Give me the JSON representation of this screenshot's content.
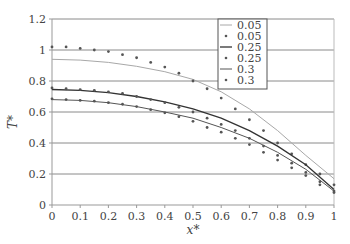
{
  "chart_data": {
    "type": "line",
    "title": "",
    "xlabel": "x*",
    "ylabel": "T*",
    "xlim": [
      0,
      1
    ],
    "ylim": [
      0,
      1.2
    ],
    "xticks": [
      "0",
      "0.1",
      "0.2",
      "0.3",
      "0.4",
      "0.5",
      "0.6",
      "0.7",
      "0.8",
      "0.9",
      "1"
    ],
    "yticks": [
      "0",
      "0.2",
      "0.4",
      "0.6",
      "0.8",
      "1",
      "1.2"
    ],
    "grid": "horizontal",
    "legend_position": "upper right (inside)",
    "series": [
      {
        "name": "0.05",
        "style": "line",
        "color": "#a8a8a8",
        "x": [
          0,
          0.1,
          0.2,
          0.3,
          0.4,
          0.5,
          0.55,
          0.6,
          0.7,
          0.8,
          0.85,
          0.9,
          1.0
        ],
        "y": [
          0.94,
          0.935,
          0.92,
          0.895,
          0.86,
          0.81,
          0.77,
          0.73,
          0.62,
          0.48,
          0.4,
          0.32,
          0.17
        ]
      },
      {
        "name": "0.05",
        "style": "markers",
        "color": "#555555",
        "x": [
          0,
          0.05,
          0.1,
          0.15,
          0.2,
          0.25,
          0.3,
          0.35,
          0.4,
          0.45,
          0.5,
          0.55,
          0.6,
          0.65,
          0.7,
          0.75,
          0.8,
          0.85,
          0.9,
          0.95,
          1.0
        ],
        "y": [
          1.02,
          1.02,
          1.01,
          1.0,
          0.99,
          0.97,
          0.95,
          0.92,
          0.89,
          0.85,
          0.8,
          0.75,
          0.69,
          0.62,
          0.55,
          0.48,
          0.4,
          0.33,
          0.26,
          0.2,
          0.13
        ]
      },
      {
        "name": "0.25",
        "style": "line",
        "color": "#333333",
        "x": [
          0,
          0.1,
          0.2,
          0.3,
          0.4,
          0.5,
          0.6,
          0.7,
          0.8,
          0.9,
          1.0
        ],
        "y": [
          0.745,
          0.74,
          0.725,
          0.7,
          0.665,
          0.62,
          0.56,
          0.48,
          0.38,
          0.26,
          0.1
        ]
      },
      {
        "name": "0.25",
        "style": "markers",
        "color": "#555555",
        "x": [
          0,
          0.05,
          0.1,
          0.15,
          0.2,
          0.25,
          0.3,
          0.35,
          0.4,
          0.45,
          0.5,
          0.55,
          0.6,
          0.65,
          0.7,
          0.75,
          0.8,
          0.85,
          0.9,
          0.95,
          1.0
        ],
        "y": [
          0.755,
          0.75,
          0.745,
          0.74,
          0.73,
          0.72,
          0.7,
          0.68,
          0.66,
          0.63,
          0.6,
          0.56,
          0.52,
          0.48,
          0.43,
          0.38,
          0.32,
          0.27,
          0.21,
          0.15,
          0.09
        ]
      },
      {
        "name": "0.3",
        "style": "line",
        "color": "#555555",
        "x": [
          0,
          0.1,
          0.2,
          0.3,
          0.4,
          0.5,
          0.6,
          0.7,
          0.8,
          0.9,
          1.0
        ],
        "y": [
          0.68,
          0.675,
          0.66,
          0.635,
          0.6,
          0.56,
          0.5,
          0.43,
          0.34,
          0.23,
          0.09
        ]
      },
      {
        "name": "0.3",
        "style": "markers",
        "color": "#555555",
        "x": [
          0,
          0.05,
          0.1,
          0.15,
          0.2,
          0.25,
          0.3,
          0.35,
          0.4,
          0.45,
          0.5,
          0.55,
          0.6,
          0.65,
          0.7,
          0.75,
          0.8,
          0.85,
          0.9,
          0.95,
          1.0
        ],
        "y": [
          0.685,
          0.68,
          0.675,
          0.67,
          0.66,
          0.65,
          0.635,
          0.615,
          0.595,
          0.57,
          0.54,
          0.5,
          0.47,
          0.43,
          0.39,
          0.34,
          0.29,
          0.24,
          0.19,
          0.13,
          0.08
        ]
      }
    ]
  }
}
